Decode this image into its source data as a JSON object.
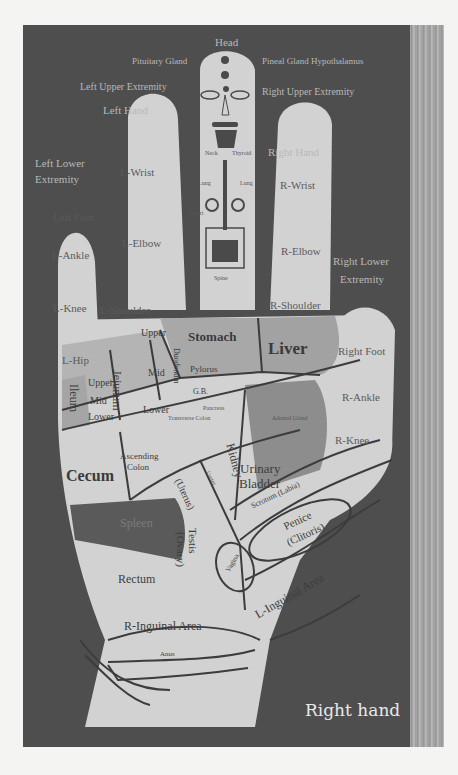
{
  "figure": {
    "caption": "Right hand",
    "colors": {
      "background": "#f4f4f2",
      "panel": "#4e4e4e",
      "hand": "#d2d2d2",
      "shaded_region": "#8a8a8a",
      "dark_region": "#5a5a5a",
      "outline": "#3c3c3c",
      "caption_text": "#e8e8e8"
    }
  },
  "labels": {
    "head": "Head",
    "pituitary": "Pituitary Gland",
    "pineal": "Pineal Gland Hypothalamus",
    "left_upper_extremity": "Left Upper Extremity",
    "right_upper_extremity": "Right Upper Extremity",
    "left_hand": "Left Hand",
    "right_hand": "Right Hand",
    "left_lower_extremity_1": "Left Lower",
    "left_lower_extremity_2": "Extremity",
    "right_lower_extremity_1": "Right Lower",
    "right_lower_extremity_2": "Extremity",
    "l_wrist": "L-Wrist",
    "r_wrist": "R-Wrist",
    "left_foot": "Left Foot",
    "right_foot": "Right Foot",
    "l_ankle": "L-Ankle",
    "r_ankle": "R-Ankle",
    "l_elbow": "L-Elbow",
    "r_elbow": "R-Elbow",
    "l_knee": "L-Knee",
    "r_knee": "R-Knee",
    "l_shoulder": "L-Shoulder",
    "r_shoulder": "R-Shoulder",
    "l_hip": "L-Hip",
    "neck": "Neck",
    "thyroid": "Thyroid",
    "lungs_l": "Lung",
    "lungs_r": "Lung",
    "heart": "Heart",
    "spine": "Spine"
  },
  "organs": {
    "stomach": "Stomach",
    "liver": "Liver",
    "duodenum": "Duodenum",
    "jejunum": "Jejunum",
    "ileum": "Ileum",
    "upper_1": "Upper",
    "mid_1": "Mid",
    "lower_1": "Lower",
    "upper_2": "Upper",
    "mid_2": "Mid",
    "lower_2": "Lower",
    "pylorus": "Pylorus",
    "gb": "G.B.",
    "pancreas": "Pancreas",
    "transverse_colon": "Transverse Colon",
    "ascending_colon_1": "Ascending",
    "ascending_colon_2": "Colon",
    "cecum": "Cecum",
    "kidney": "Kidney",
    "ureter": "Ureter",
    "uterus": "(Uterus)",
    "urinary_bladder_1": "Urinary",
    "urinary_bladder_2": "Bladder",
    "adrenal_gland": "Adrenal Gland",
    "spleen": "Spleen",
    "testis": "Testis",
    "ovary": "(Ovary)",
    "scrotum": "Scrotum (Labia)",
    "penis": "Penice",
    "clitoris": "(Clitoris)",
    "vagina": "Vagina",
    "rectum": "Rectum",
    "l_inguinal": "L-Inguinal Area",
    "r_inguinal": "R-Inguinal Area",
    "anus": "Anus"
  }
}
